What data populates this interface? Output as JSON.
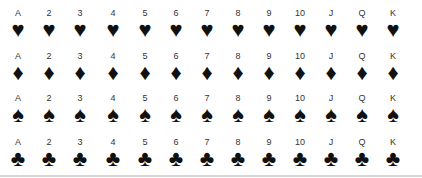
{
  "ranks": [
    "A",
    "2",
    "3",
    "4",
    "5",
    "6",
    "7",
    "8",
    "9",
    "10",
    "J",
    "Q",
    "K"
  ],
  "rows": [
    {
      "suit": "hearts",
      "glyph": "♥"
    },
    {
      "suit": "diamonds",
      "glyph": "♦"
    },
    {
      "suit": "spades",
      "glyph": "♠"
    },
    {
      "suit": "clubs",
      "glyph": "♣"
    }
  ]
}
